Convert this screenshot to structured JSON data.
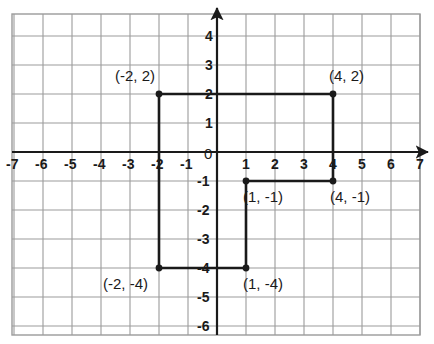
{
  "chart_data": {
    "type": "scatter",
    "title": "",
    "xlabel": "",
    "ylabel": "",
    "xlim": [
      -7.5,
      7.5
    ],
    "ylim": [
      -6.5,
      4.5
    ],
    "grid": true,
    "legend": null,
    "x_ticks": [
      "-7",
      "-6",
      "-5",
      "-4",
      "-3",
      "-2",
      "-1",
      "1",
      "2",
      "3",
      "4",
      "5",
      "6",
      "7"
    ],
    "x_tick_values": [
      -7,
      -6,
      -5,
      -4,
      -3,
      -2,
      -1,
      1,
      2,
      3,
      4,
      5,
      6,
      7
    ],
    "y_ticks": [
      "4",
      "3",
      "2",
      "1",
      "-1",
      "-2",
      "-3",
      "-4",
      "-5",
      "-6"
    ],
    "y_tick_values": [
      4,
      3,
      2,
      1,
      -1,
      -2,
      -3,
      -4,
      -5,
      -6
    ],
    "origin_label": "0",
    "points": [
      {
        "label": "(-2, 2)",
        "x": -2,
        "y": 2,
        "label_dx": -44,
        "label_dy": -26
      },
      {
        "label": "(4, 2)",
        "x": 4,
        "y": 2,
        "label_dx": -4,
        "label_dy": -26
      },
      {
        "label": "(4, -1)",
        "x": 4,
        "y": -1,
        "label_dx": -3,
        "label_dy": 8
      },
      {
        "label": "(1, -1)",
        "x": 1,
        "y": -1,
        "label_dx": -3,
        "label_dy": 8
      },
      {
        "label": "(1, -4)",
        "x": 1,
        "y": -4,
        "label_dx": -3,
        "label_dy": 8
      },
      {
        "label": "(-2, -4)",
        "x": -2,
        "y": -4,
        "label_dx": -56,
        "label_dy": 8
      }
    ],
    "polygon": [
      {
        "x": -2,
        "y": 2
      },
      {
        "x": 4,
        "y": 2
      },
      {
        "x": 4,
        "y": -1
      },
      {
        "x": 1,
        "y": -1
      },
      {
        "x": 1,
        "y": -4
      },
      {
        "x": -2,
        "y": -4
      }
    ],
    "colors": {
      "grid": "#9b9b9b",
      "axis": "#1a1a1a",
      "shape": "#1a1a1a",
      "point": "#1a1a1a",
      "background": "#ffffff",
      "text": "#1a1a1a"
    }
  }
}
